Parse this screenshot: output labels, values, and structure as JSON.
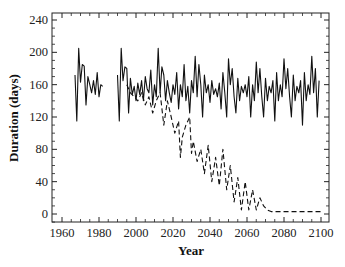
{
  "chart_data": {
    "type": "line",
    "title": "",
    "xlabel": "Year",
    "ylabel": "Duration (days)",
    "xlim": [
      1955,
      2104
    ],
    "ylim": [
      -10,
      250
    ],
    "xticks": [
      1960,
      1980,
      2000,
      2020,
      2040,
      2060,
      2080,
      2100
    ],
    "yticks": [
      0,
      40,
      80,
      120,
      160,
      200,
      240
    ],
    "grid": false,
    "legend": null,
    "series": [
      {
        "name": "solid",
        "style": "solid",
        "segments": [
          {
            "x": [
              1967,
              1968,
              1969,
              1970,
              1971,
              1972,
              1973,
              1974,
              1975,
              1976,
              1977,
              1978,
              1979,
              1980,
              1981,
              1982
            ],
            "y": [
              172,
              115,
              205,
              163,
              185,
              183,
              135,
              170,
              160,
              150,
              165,
              148,
              175,
              145,
              160,
              158
            ]
          },
          {
            "x": [
              1990,
              1991,
              1992,
              1993,
              1994,
              1995,
              1996,
              1997,
              1998,
              1999,
              2000,
              2001,
              2002,
              2003,
              2004,
              2005,
              2006,
              2007,
              2008,
              2009,
              2010,
              2011,
              2012,
              2013,
              2014,
              2015,
              2016,
              2017,
              2018,
              2019,
              2020,
              2021,
              2022,
              2023,
              2024,
              2025,
              2026,
              2027,
              2028,
              2029,
              2030,
              2031,
              2032,
              2033,
              2034,
              2035,
              2036,
              2037,
              2038,
              2039,
              2040,
              2041,
              2042,
              2043,
              2044,
              2045,
              2046,
              2047,
              2048,
              2049,
              2050,
              2051,
              2052,
              2053,
              2054,
              2055,
              2056,
              2057,
              2058,
              2059,
              2060,
              2061,
              2062,
              2063,
              2064,
              2065,
              2066,
              2067,
              2068,
              2069,
              2070,
              2071,
              2072,
              2073,
              2074,
              2075,
              2076,
              2077,
              2078,
              2079,
              2080,
              2081,
              2082,
              2083,
              2084,
              2085,
              2086,
              2087,
              2088,
              2089,
              2090,
              2091,
              2092,
              2093,
              2094,
              2095,
              2096,
              2097,
              2098,
              2099
            ],
            "y": [
              172,
              115,
              205,
              165,
              182,
              180,
              125,
              168,
              148,
              158,
              140,
              162,
              148,
              165,
              140,
              170,
              155,
              150,
              178,
              135,
              160,
              145,
              205,
              150,
              182,
              172,
              140,
              165,
              150,
              138,
              160,
              148,
              175,
              130,
              160,
              145,
              185,
              140,
              158,
              125,
              165,
              150,
              195,
              145,
              185,
              160,
              120,
              172,
              150,
              160,
              138,
              165,
              148,
              155,
              145,
              162,
              130,
              175,
              150,
              120,
              192,
              160,
              180,
              145,
              125,
              168,
              140,
              158,
              150,
              160,
              145,
              170,
              120,
              160,
              140,
              188,
              150,
              180,
              145,
              120,
              168,
              140,
              158,
              150,
              165,
              115,
              175,
              140,
              160,
              145,
              192,
              155,
              180,
              145,
              120,
              172,
              140,
              158,
              150,
              165,
              110,
              175,
              140,
              160,
              148,
              195,
              150,
              180,
              120,
              165
            ]
          }
        ]
      },
      {
        "name": "dashed",
        "style": "dashed",
        "segments": [
          {
            "x": [
              1995,
              1997,
              1999,
              2001,
              2003,
              2005,
              2007,
              2009,
              2011,
              2013,
              2015,
              2017,
              2019,
              2021,
              2023,
              2024,
              2025,
              2027,
              2029,
              2030,
              2031,
              2033,
              2035,
              2037,
              2039,
              2041,
              2043,
              2045,
              2047,
              2049,
              2051,
              2053,
              2055,
              2057,
              2059,
              2061,
              2063,
              2065,
              2067,
              2069,
              2071,
              2073,
              2080,
              2090,
              2100
            ],
            "y": [
              160,
              150,
              145,
              140,
              150,
              135,
              145,
              125,
              140,
              150,
              110,
              140,
              120,
              100,
              115,
              70,
              95,
              110,
              120,
              75,
              90,
              65,
              80,
              50,
              85,
              40,
              70,
              35,
              80,
              30,
              60,
              15,
              45,
              5,
              40,
              5,
              30,
              5,
              20,
              10,
              5,
              3,
              3,
              3,
              3
            ]
          }
        ]
      }
    ]
  }
}
